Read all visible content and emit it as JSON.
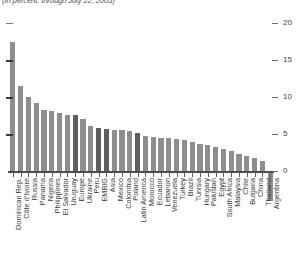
{
  "subtitle": "(In percent, through July 22, 2005)",
  "axis": {
    "y_ticks": [
      "20",
      "15",
      "10",
      "5",
      "0"
    ]
  },
  "colors": {
    "bar": "#8e8e8e",
    "bar_aggregate": "#5e5e5e",
    "axis": "#4d4d4d",
    "text": "#3a3a3a"
  },
  "chart_data": {
    "type": "bar",
    "title": "",
    "subtitle": "(In percent, through July 22, 2005)",
    "xlabel": "",
    "ylabel": "",
    "ylim": [
      -5,
      20
    ],
    "yticks": [
      0,
      5,
      10,
      15,
      20
    ],
    "grid": false,
    "legend": "none",
    "orientation": "vertical",
    "sorted": "descending",
    "categories": [
      "Dominican Rep.",
      "Côte d'Ivoire",
      "Russia",
      "Panama",
      "Nigeria",
      "Philippines",
      "El Salvador",
      "Uruguay",
      "Europe",
      "Ukraine",
      "Peru",
      "EMBIG",
      "Asia",
      "Mexico",
      "Colombia",
      "Poland",
      "Latin America",
      "Morocco",
      "Ecuador",
      "Lebanon",
      "Venezuela",
      "Turkey",
      "Brazil",
      "Tunisia",
      "Hungary",
      "Pakistan",
      "Egypt",
      "South Africa",
      "Malaysia",
      "Chile",
      "Bulgaria",
      "China",
      "Thailand",
      "Argentina"
    ],
    "values": [
      17.5,
      11.5,
      10.0,
      9.2,
      8.2,
      8.1,
      7.8,
      7.6,
      7.6,
      7.0,
      6.1,
      5.8,
      5.7,
      5.6,
      5.6,
      5.4,
      5.2,
      4.7,
      4.6,
      4.5,
      4.4,
      4.3,
      4.2,
      3.9,
      3.7,
      3.5,
      3.3,
      3.0,
      2.7,
      2.3,
      2.0,
      1.7,
      1.3,
      -4.0
    ],
    "aggregate_flags": [
      false,
      false,
      false,
      false,
      false,
      false,
      false,
      false,
      true,
      false,
      false,
      true,
      true,
      false,
      false,
      false,
      true,
      false,
      false,
      false,
      false,
      false,
      false,
      false,
      false,
      false,
      false,
      false,
      false,
      false,
      false,
      false,
      false,
      false
    ]
  }
}
